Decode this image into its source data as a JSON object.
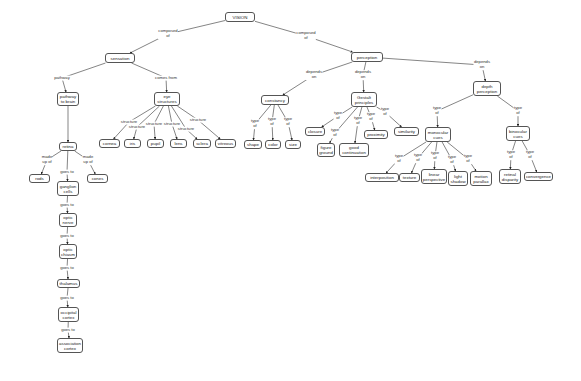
{
  "diagram": {
    "title": "VISION",
    "nodes": [
      {
        "id": "vision",
        "label": "VISION",
        "x": 225,
        "y": 12,
        "w": 30,
        "h": 10
      },
      {
        "id": "sensation",
        "label": "sensation",
        "x": 105,
        "y": 53,
        "w": 30,
        "h": 10
      },
      {
        "id": "perception",
        "label": "perception",
        "x": 351,
        "y": 52,
        "w": 32,
        "h": 10
      },
      {
        "id": "pathway",
        "label": "pathway\nto brain",
        "x": 57,
        "y": 92,
        "w": 22,
        "h": 14
      },
      {
        "id": "eye",
        "label": "eye\nstructures",
        "x": 154,
        "y": 92,
        "w": 26,
        "h": 14
      },
      {
        "id": "retina",
        "label": "retina",
        "x": 59,
        "y": 142,
        "w": 18,
        "h": 9
      },
      {
        "id": "rods",
        "label": "rods",
        "x": 29,
        "y": 174,
        "w": 21,
        "h": 9
      },
      {
        "id": "cones",
        "label": "cones",
        "x": 87,
        "y": 174,
        "w": 21,
        "h": 9
      },
      {
        "id": "ganglion",
        "label": "ganglion\ncells",
        "x": 57,
        "y": 181,
        "w": 22,
        "h": 15
      },
      {
        "id": "opticnerve",
        "label": "optic\nnerve",
        "x": 59,
        "y": 213,
        "w": 18,
        "h": 14
      },
      {
        "id": "chiasm",
        "label": "optic\nchiasm",
        "x": 59,
        "y": 244,
        "w": 18,
        "h": 15
      },
      {
        "id": "thalamus",
        "label": "thalamus",
        "x": 57,
        "y": 279,
        "w": 23,
        "h": 9
      },
      {
        "id": "occipital",
        "label": "occipital\ncortex",
        "x": 58,
        "y": 307,
        "w": 21,
        "h": 15
      },
      {
        "id": "association",
        "label": "association\ncortex",
        "x": 57,
        "y": 338,
        "w": 26,
        "h": 15
      },
      {
        "id": "cornea",
        "label": "cornea",
        "x": 99,
        "y": 139,
        "w": 21,
        "h": 9
      },
      {
        "id": "iris",
        "label": "iris",
        "x": 124,
        "y": 139,
        "w": 17,
        "h": 9
      },
      {
        "id": "pupil",
        "label": "pupil",
        "x": 147,
        "y": 139,
        "w": 17,
        "h": 9
      },
      {
        "id": "lens",
        "label": "lens",
        "x": 170,
        "y": 139,
        "w": 17,
        "h": 9
      },
      {
        "id": "sclera",
        "label": "sclera",
        "x": 193,
        "y": 139,
        "w": 18,
        "h": 9
      },
      {
        "id": "vitreous",
        "label": "vitreous",
        "x": 215,
        "y": 139,
        "w": 21,
        "h": 9
      },
      {
        "id": "constancy",
        "label": "constancy",
        "x": 261,
        "y": 95,
        "w": 28,
        "h": 10
      },
      {
        "id": "shape",
        "label": "shape",
        "x": 244,
        "y": 140,
        "w": 18,
        "h": 9
      },
      {
        "id": "color",
        "label": "color",
        "x": 265,
        "y": 140,
        "w": 16,
        "h": 9
      },
      {
        "id": "size",
        "label": "size",
        "x": 285,
        "y": 140,
        "w": 16,
        "h": 9
      },
      {
        "id": "gestalt",
        "label": "Gestalt\nprinciples",
        "x": 351,
        "y": 92,
        "w": 26,
        "h": 15
      },
      {
        "id": "closure",
        "label": "closure",
        "x": 305,
        "y": 127,
        "w": 20,
        "h": 9
      },
      {
        "id": "figure",
        "label": "figure\nground",
        "x": 317,
        "y": 143,
        "w": 18,
        "h": 14
      },
      {
        "id": "goodcont",
        "label": "good\ncontinuation",
        "x": 339,
        "y": 143,
        "w": 30,
        "h": 14
      },
      {
        "id": "proximity",
        "label": "proximity",
        "x": 364,
        "y": 130,
        "w": 24,
        "h": 9
      },
      {
        "id": "similarity",
        "label": "similarity",
        "x": 394,
        "y": 127,
        "w": 25,
        "h": 9
      },
      {
        "id": "depth",
        "label": "depth\nperception",
        "x": 473,
        "y": 81,
        "w": 28,
        "h": 15
      },
      {
        "id": "monocular",
        "label": "monocular\ncues",
        "x": 425,
        "y": 127,
        "w": 26,
        "h": 15
      },
      {
        "id": "binocular",
        "label": "binocular\ncues",
        "x": 506,
        "y": 126,
        "w": 24,
        "h": 15
      },
      {
        "id": "interposition",
        "label": "interposition",
        "x": 365,
        "y": 173,
        "w": 34,
        "h": 9
      },
      {
        "id": "texture",
        "label": "texture",
        "x": 399,
        "y": 173,
        "w": 21,
        "h": 9
      },
      {
        "id": "linear",
        "label": "linear\nperspective",
        "x": 421,
        "y": 169,
        "w": 26,
        "h": 15
      },
      {
        "id": "lightshadow",
        "label": "light\nshadow",
        "x": 448,
        "y": 171,
        "w": 20,
        "h": 15
      },
      {
        "id": "motion",
        "label": "motion\nparallax",
        "x": 470,
        "y": 171,
        "w": 22,
        "h": 15
      },
      {
        "id": "retinal",
        "label": "retinal\ndisparity",
        "x": 499,
        "y": 169,
        "w": 22,
        "h": 15
      },
      {
        "id": "convergence",
        "label": "convergence",
        "x": 524,
        "y": 172,
        "w": 29,
        "h": 9
      }
    ],
    "links": [
      {
        "from": "vision",
        "to": "sensation",
        "label": "composed\nof",
        "lx": 168,
        "ly": 34
      },
      {
        "from": "vision",
        "to": "perception",
        "label": "composed\nof",
        "lx": 306,
        "ly": 36
      },
      {
        "from": "sensation",
        "to": "pathway",
        "label": "pathway",
        "lx": 62,
        "ly": 78
      },
      {
        "from": "sensation",
        "to": "eye",
        "label": "comes from",
        "lx": 166,
        "ly": 78
      },
      {
        "from": "pathway",
        "to": "retina",
        "label": "",
        "lx": 0,
        "ly": 0
      },
      {
        "from": "retina",
        "to": "rods",
        "label": "made\nup of",
        "lx": 47,
        "ly": 160
      },
      {
        "from": "retina",
        "to": "cones",
        "label": "made\nup of",
        "lx": 88,
        "ly": 160
      },
      {
        "from": "retina",
        "to": "ganglion",
        "label": "goes to",
        "lx": 67,
        "ly": 172
      },
      {
        "from": "ganglion",
        "to": "opticnerve",
        "label": "goes to",
        "lx": 67,
        "ly": 205
      },
      {
        "from": "opticnerve",
        "to": "chiasm",
        "label": "goes to",
        "lx": 67,
        "ly": 236
      },
      {
        "from": "chiasm",
        "to": "thalamus",
        "label": "goes to",
        "lx": 67,
        "ly": 268
      },
      {
        "from": "thalamus",
        "to": "occipital",
        "label": "goes to",
        "lx": 67,
        "ly": 298
      },
      {
        "from": "occipital",
        "to": "association",
        "label": "goes to",
        "lx": 68,
        "ly": 330
      },
      {
        "from": "eye",
        "to": "cornea",
        "label": "structure",
        "lx": 129,
        "ly": 122
      },
      {
        "from": "eye",
        "to": "iris",
        "label": "structure",
        "lx": 137,
        "ly": 127
      },
      {
        "from": "eye",
        "to": "pupil",
        "label": "structure",
        "lx": 154,
        "ly": 124
      },
      {
        "from": "eye",
        "to": "lens",
        "label": "structure",
        "lx": 172,
        "ly": 124
      },
      {
        "from": "eye",
        "to": "sclera",
        "label": "structure",
        "lx": 186,
        "ly": 129
      },
      {
        "from": "eye",
        "to": "vitreous",
        "label": "structure",
        "lx": 198,
        "ly": 120
      },
      {
        "from": "perception",
        "to": "constancy",
        "label": "depends\non",
        "lx": 314,
        "ly": 75
      },
      {
        "from": "perception",
        "to": "gestalt",
        "label": "depends\non",
        "lx": 363,
        "ly": 75
      },
      {
        "from": "perception",
        "to": "depth",
        "label": "depends\non",
        "lx": 482,
        "ly": 65
      },
      {
        "from": "constancy",
        "to": "shape",
        "label": "type\nof",
        "lx": 255,
        "ly": 124
      },
      {
        "from": "constancy",
        "to": "color",
        "label": "type\nof",
        "lx": 272,
        "ly": 122
      },
      {
        "from": "constancy",
        "to": "size",
        "label": "type\nof",
        "lx": 288,
        "ly": 122
      },
      {
        "from": "gestalt",
        "to": "closure",
        "label": "type\nof",
        "lx": 338,
        "ly": 116
      },
      {
        "from": "gestalt",
        "to": "figure",
        "label": "type\nof",
        "lx": 335,
        "ly": 133
      },
      {
        "from": "gestalt",
        "to": "goodcont",
        "label": "type\nof",
        "lx": 358,
        "ly": 121
      },
      {
        "from": "gestalt",
        "to": "proximity",
        "label": "type\nof",
        "lx": 371,
        "ly": 117
      },
      {
        "from": "gestalt",
        "to": "similarity",
        "label": "type\nof",
        "lx": 385,
        "ly": 112
      },
      {
        "from": "depth",
        "to": "monocular",
        "label": "type\nof",
        "lx": 437,
        "ly": 111
      },
      {
        "from": "depth",
        "to": "binocular",
        "label": "type\nof",
        "lx": 518,
        "ly": 111
      },
      {
        "from": "monocular",
        "to": "interposition",
        "label": "type\nof",
        "lx": 399,
        "ly": 159
      },
      {
        "from": "monocular",
        "to": "texture",
        "label": "type\nof",
        "lx": 418,
        "ly": 158
      },
      {
        "from": "monocular",
        "to": "linear",
        "label": "type\nof",
        "lx": 435,
        "ly": 156
      },
      {
        "from": "monocular",
        "to": "lightshadow",
        "label": "type\nof",
        "lx": 452,
        "ly": 160
      },
      {
        "from": "monocular",
        "to": "motion",
        "label": "type\nof",
        "lx": 468,
        "ly": 159
      },
      {
        "from": "binocular",
        "to": "retinal",
        "label": "type\nof",
        "lx": 511,
        "ly": 155
      },
      {
        "from": "binocular",
        "to": "convergence",
        "label": "type\nof",
        "lx": 530,
        "ly": 155
      }
    ]
  }
}
